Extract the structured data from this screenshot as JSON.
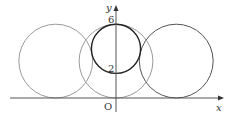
{
  "diagram": {
    "axes": {
      "x_label": "x",
      "y_label": "y",
      "origin_label": "O"
    },
    "y_tick_labels": [
      {
        "value": 6,
        "text": "6"
      },
      {
        "value": 2,
        "text": "2"
      }
    ],
    "circles": [
      {
        "name": "left-circle",
        "cx": -4.9,
        "cy": 3,
        "r": 3,
        "color": "#9a9a9a"
      },
      {
        "name": "middle-circle",
        "cx": 0,
        "cy": 3,
        "r": 3,
        "color": "#9a9a9a"
      },
      {
        "name": "right-circle",
        "cx": 4.9,
        "cy": 3,
        "r": 3,
        "color": "#555555"
      },
      {
        "name": "small-circle",
        "cx": 0,
        "cy": 4,
        "r": 2,
        "color": "#222222"
      }
    ]
  }
}
